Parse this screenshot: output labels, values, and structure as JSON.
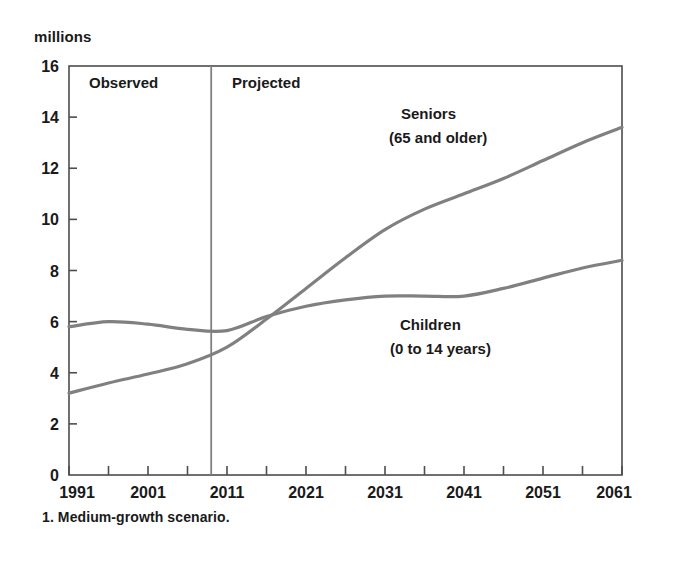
{
  "figure": {
    "y_axis_unit": "millions",
    "footnote": "1. Medium-growth scenario."
  },
  "regions": {
    "observed_label": "Observed",
    "projected_label": "Projected",
    "divider_year": 2009
  },
  "series_labels": {
    "seniors_line1": "Seniors",
    "seniors_line2": "(65 and older)",
    "children_line1": "Children",
    "children_line2": "(0 to 14 years)"
  },
  "colors": {
    "line": "#808080",
    "axis": "#4d4d4d",
    "divider": "#808080",
    "text": "#1a1a1a",
    "background": "#ffffff"
  },
  "chart_data": {
    "type": "line",
    "title": "",
    "xlabel": "",
    "ylabel": "millions",
    "xlim": [
      1991,
      2061
    ],
    "ylim": [
      0,
      16
    ],
    "grid": false,
    "legend": "inline-annotations",
    "ytick_labels": [
      "0",
      "2",
      "4",
      "6",
      "8",
      "10",
      "12",
      "14",
      "16"
    ],
    "ytick_values": [
      0,
      2,
      4,
      6,
      8,
      10,
      12,
      14,
      16
    ],
    "xtick_labels": [
      "1991",
      "2001",
      "2011",
      "2021",
      "2031",
      "2041",
      "2051",
      "2061"
    ],
    "xtick_values": [
      1991,
      2001,
      2011,
      2021,
      2031,
      2041,
      2051,
      2061
    ],
    "xminor_tick_values": [
      1996,
      2006,
      2016,
      2026,
      2036,
      2046,
      2056
    ],
    "annotations": [
      {
        "text": "Observed",
        "x": 2000,
        "y": 15.2
      },
      {
        "text": "Projected",
        "x": 2021,
        "y": 15.2
      },
      {
        "text": "Seniors",
        "x": 2034,
        "y": 14.2
      },
      {
        "text": "(65 and older)",
        "x": 2034,
        "y": 13.2
      },
      {
        "text": "Children",
        "x": 2036,
        "y": 6.3
      },
      {
        "text": "(0 to 14 years)",
        "x": 2036,
        "y": 5.4
      }
    ],
    "vertical_divider": {
      "x": 2009,
      "label_left": "Observed",
      "label_right": "Projected"
    },
    "series": [
      {
        "name": "Seniors (65 and older)",
        "color": "#808080",
        "x": [
          1991,
          1996,
          2001,
          2006,
          2011,
          2016,
          2021,
          2026,
          2031,
          2036,
          2041,
          2046,
          2051,
          2056,
          2061
        ],
        "values": [
          3.2,
          3.6,
          3.95,
          4.35,
          5.0,
          6.1,
          7.3,
          8.5,
          9.6,
          10.4,
          11.0,
          11.6,
          12.3,
          13.0,
          13.6
        ]
      },
      {
        "name": "Children (0 to 14 years)",
        "color": "#808080",
        "x": [
          1991,
          1996,
          2001,
          2006,
          2011,
          2016,
          2021,
          2026,
          2031,
          2036,
          2041,
          2046,
          2051,
          2056,
          2061
        ],
        "values": [
          5.8,
          6.0,
          5.9,
          5.7,
          5.65,
          6.2,
          6.6,
          6.85,
          7.0,
          7.0,
          7.0,
          7.3,
          7.7,
          8.1,
          8.4
        ]
      }
    ]
  }
}
